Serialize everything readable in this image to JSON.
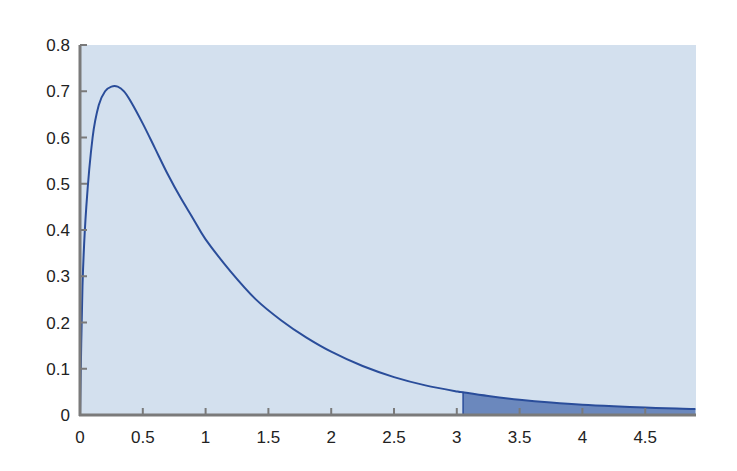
{
  "chart_data": {
    "type": "area",
    "title": "",
    "xlabel": "",
    "ylabel": "",
    "xlim": [
      0,
      4.9
    ],
    "ylim": [
      0,
      0.8
    ],
    "grid": false,
    "legend": null,
    "x_ticks": [
      "0",
      "0.5",
      "1",
      "1.5",
      "2",
      "2.5",
      "3",
      "3.5",
      "4",
      "4.5"
    ],
    "x_tick_values": [
      0,
      0.5,
      1,
      1.5,
      2,
      2.5,
      3,
      3.5,
      4,
      4.5
    ],
    "y_ticks": [
      "0",
      "0.1",
      "0.2",
      "0.3",
      "0.4",
      "0.5",
      "0.6",
      "0.7",
      "0.8"
    ],
    "y_tick_values": [
      0,
      0.1,
      0.2,
      0.3,
      0.4,
      0.5,
      0.6,
      0.7,
      0.8
    ],
    "series": [
      {
        "name": "density",
        "x": [
          0.0,
          0.02,
          0.05,
          0.1,
          0.15,
          0.2,
          0.25,
          0.3,
          0.35,
          0.4,
          0.5,
          0.6,
          0.7,
          0.8,
          0.9,
          1.0,
          1.2,
          1.4,
          1.6,
          1.8,
          2.0,
          2.25,
          2.5,
          2.75,
          3.0,
          3.05,
          3.25,
          3.5,
          3.75,
          4.0,
          4.25,
          4.5,
          4.75,
          4.9
        ],
        "y": [
          0.0,
          0.28,
          0.45,
          0.6,
          0.67,
          0.7,
          0.71,
          0.71,
          0.7,
          0.68,
          0.63,
          0.575,
          0.52,
          0.47,
          0.425,
          0.38,
          0.31,
          0.25,
          0.205,
          0.168,
          0.137,
          0.106,
          0.082,
          0.064,
          0.051,
          0.049,
          0.041,
          0.033,
          0.027,
          0.022,
          0.019,
          0.016,
          0.014,
          0.013
        ]
      }
    ],
    "shaded_region": {
      "x_start": 3.05,
      "x_end": 4.9,
      "label": "upper tail area"
    },
    "colors": {
      "plot_background": "#d3e0ee",
      "curve": "#2a4d9a",
      "shaded_fill": "#6b88bd",
      "axis": "#7a7a7a"
    }
  }
}
